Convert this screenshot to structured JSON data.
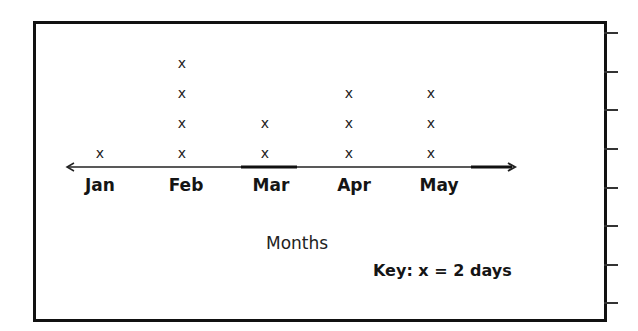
{
  "chart_data": {
    "type": "line_plot",
    "title": "",
    "xlabel": "Months",
    "ylabel": "",
    "categories": [
      "Jan",
      "Feb",
      "Mar",
      "Apr",
      "May"
    ],
    "values": [
      1,
      4,
      2,
      3,
      3
    ],
    "marker": "x",
    "key": "Key: x = 2 days",
    "days_per_mark": 2,
    "days": [
      2,
      8,
      4,
      6,
      6
    ]
  },
  "labels": {
    "months": [
      "Jan",
      "Feb",
      "Mar",
      "Apr",
      "May"
    ],
    "x_axis": "Months",
    "key": "Key: x = 2 days",
    "mark": "x"
  }
}
